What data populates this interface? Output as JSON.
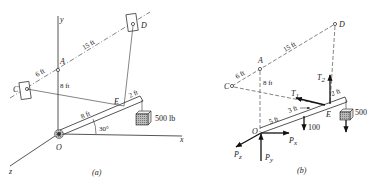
{
  "figure_a": {
    "caption": "(a)",
    "axes": {
      "x": "x",
      "y": "y",
      "z": "z"
    },
    "points": {
      "A": "A",
      "C": "C",
      "D": "D",
      "E": "E",
      "O": "O"
    },
    "dimensions": {
      "CA": "6 ft",
      "AD": "15 ft",
      "OA": "8 ft",
      "OE": "8 ft",
      "E_end": "2 ft"
    },
    "angle": "30°",
    "load": "500 lb"
  },
  "figure_b": {
    "caption": "(b)",
    "points": {
      "A": "A",
      "C": "C",
      "D": "D",
      "E": "E",
      "O": "O"
    },
    "dimensions": {
      "CA": "6 ft",
      "AD": "15 ft",
      "OA": "8 ft",
      "O_mid": "5 ft",
      "mid_E": "3 ft",
      "E_end": "2 ft"
    },
    "forces": {
      "T1": "T",
      "T1_sub": "1",
      "T2": "T",
      "T2_sub": "2",
      "Px": "P",
      "Px_sub": "x",
      "Py": "P",
      "Py_sub": "y",
      "Pz": "P",
      "Pz_sub": "z",
      "weight_bar": "100",
      "weight_load": "500"
    }
  }
}
